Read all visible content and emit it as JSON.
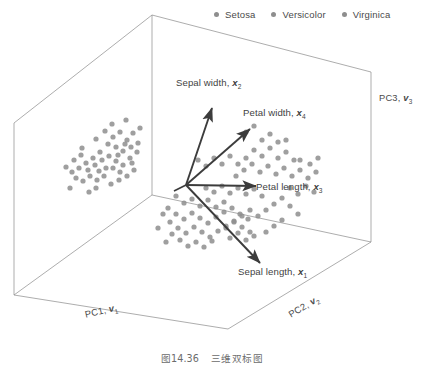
{
  "figure": {
    "caption_number": "图14.36",
    "caption_title": "三维双标图"
  },
  "legend": {
    "position": "top-right",
    "items": [
      {
        "label": "Setosa",
        "color": "#8e8e8e",
        "marker": "legend-dot-setosa"
      },
      {
        "label": "Versicolor",
        "color": "#8e8e8e",
        "marker": "legend-dot-versicolor"
      },
      {
        "label": "Virginica",
        "color": "#8e8e8e",
        "marker": "legend-dot-virginica"
      }
    ]
  },
  "axes": {
    "pc1": {
      "text": "PC1,",
      "vector": "v",
      "sub": "1"
    },
    "pc2": {
      "text": "PC2,",
      "vector": "v",
      "sub": "2"
    },
    "pc3": {
      "text": "PC3,",
      "vector": "v",
      "sub": "3"
    }
  },
  "vectors": [
    {
      "name": "sepal-width",
      "text": "Sepal width,",
      "var": "x",
      "sub": "2"
    },
    {
      "name": "petal-width",
      "text": "Petal width,",
      "var": "x",
      "sub": "4"
    },
    {
      "name": "petal-length",
      "text": "Petal length,",
      "var": "x",
      "sub": "3"
    },
    {
      "name": "sepal-length",
      "text": "Sepal length,",
      "var": "x",
      "sub": "1"
    }
  ],
  "colors": {
    "point": "#8e8e8e",
    "frame": "#8a8a8a",
    "arrow": "#3c3c3c",
    "text": "#3f3f3f"
  },
  "chart_data": {
    "type": "scatter",
    "title": "三维双标图",
    "xlabel": "PC1, v1",
    "ylabel": "PC2, v2",
    "zlabel": "PC3, v3",
    "grid": false,
    "legend_position": "top-right",
    "series": [
      {
        "name": "Setosa",
        "color": "#8e8e8e",
        "points": [
          [
            82,
            148
          ],
          [
            96,
            139
          ],
          [
            105,
            131
          ],
          [
            113,
            137
          ],
          [
            120,
            132
          ],
          [
            127,
            140
          ],
          [
            133,
            133
          ],
          [
            108,
            144
          ],
          [
            116,
            147
          ],
          [
            123,
            151
          ],
          [
            131,
            147
          ],
          [
            138,
            143
          ],
          [
            100,
            152
          ],
          [
            93,
            158
          ],
          [
            86,
            163
          ],
          [
            79,
            168
          ],
          [
            72,
            172
          ],
          [
            66,
            167
          ],
          [
            74,
            160
          ],
          [
            81,
            155
          ],
          [
            88,
            170
          ],
          [
            95,
            165
          ],
          [
            102,
            160
          ],
          [
            109,
            156
          ],
          [
            116,
            161
          ],
          [
            123,
            165
          ],
          [
            130,
            158
          ],
          [
            137,
            152
          ],
          [
            113,
            168
          ],
          [
            120,
            172
          ],
          [
            104,
            176
          ],
          [
            97,
            180
          ],
          [
            90,
            176
          ],
          [
            83,
            181
          ],
          [
            76,
            178
          ],
          [
            112,
            124
          ],
          [
            126,
            120
          ],
          [
            140,
            128
          ],
          [
            134,
            170
          ],
          [
            127,
            176
          ],
          [
            119,
            180
          ],
          [
            111,
            184
          ],
          [
            70,
            188
          ],
          [
            96,
            188
          ],
          [
            89,
            192
          ],
          [
            106,
            168
          ],
          [
            99,
            171
          ],
          [
            118,
            155
          ],
          [
            125,
            144
          ],
          [
            132,
            163
          ]
        ]
      },
      {
        "name": "Versicolor",
        "color": "#8e8e8e",
        "points": [
          [
            176,
            196
          ],
          [
            184,
            203
          ],
          [
            192,
            199
          ],
          [
            200,
            206
          ],
          [
            208,
            200
          ],
          [
            216,
            207
          ],
          [
            224,
            202
          ],
          [
            168,
            208
          ],
          [
            176,
            214
          ],
          [
            184,
            219
          ],
          [
            192,
            213
          ],
          [
            200,
            218
          ],
          [
            208,
            223
          ],
          [
            216,
            217
          ],
          [
            224,
            212
          ],
          [
            232,
            208
          ],
          [
            240,
            214
          ],
          [
            248,
            219
          ],
          [
            170,
            222
          ],
          [
            178,
            228
          ],
          [
            186,
            233
          ],
          [
            194,
            227
          ],
          [
            202,
            232
          ],
          [
            210,
            237
          ],
          [
            218,
            231
          ],
          [
            226,
            226
          ],
          [
            234,
            221
          ],
          [
            242,
            227
          ],
          [
            250,
            232
          ],
          [
            163,
            214
          ],
          [
            196,
            242
          ],
          [
            204,
            247
          ],
          [
            212,
            241
          ],
          [
            188,
            246
          ],
          [
            180,
            240
          ],
          [
            230,
            238
          ],
          [
            238,
            233
          ],
          [
            246,
            240
          ],
          [
            254,
            236
          ],
          [
            172,
            234
          ],
          [
            158,
            228
          ],
          [
            166,
            242
          ],
          [
            206,
            188
          ],
          [
            214,
            192
          ],
          [
            222,
            186
          ],
          [
            230,
            193
          ],
          [
            238,
            188
          ],
          [
            246,
            194
          ],
          [
            254,
            189
          ],
          [
            262,
            196
          ]
        ]
      },
      {
        "name": "Virginica",
        "color": "#8e8e8e",
        "points": [
          [
            236,
            176
          ],
          [
            244,
            170
          ],
          [
            252,
            164
          ],
          [
            260,
            172
          ],
          [
            268,
            166
          ],
          [
            276,
            174
          ],
          [
            284,
            168
          ],
          [
            292,
            176
          ],
          [
            300,
            170
          ],
          [
            308,
            178
          ],
          [
            316,
            172
          ],
          [
            254,
            150
          ],
          [
            262,
            156
          ],
          [
            270,
            148
          ],
          [
            278,
            158
          ],
          [
            286,
            152
          ],
          [
            294,
            160
          ],
          [
            262,
            140
          ],
          [
            270,
            134
          ],
          [
            278,
            142
          ],
          [
            246,
            158
          ],
          [
            238,
            164
          ],
          [
            230,
            156
          ],
          [
            222,
            164
          ],
          [
            214,
            158
          ],
          [
            206,
            166
          ],
          [
            198,
            160
          ],
          [
            290,
            188
          ],
          [
            298,
            194
          ],
          [
            306,
            186
          ],
          [
            314,
            192
          ],
          [
            282,
            198
          ],
          [
            274,
            204
          ],
          [
            266,
            210
          ],
          [
            258,
            216
          ],
          [
            250,
            210
          ],
          [
            242,
            216
          ],
          [
            234,
            222
          ],
          [
            226,
            228
          ],
          [
            290,
            206
          ],
          [
            298,
            214
          ],
          [
            282,
            220
          ],
          [
            274,
            226
          ],
          [
            266,
            232
          ],
          [
            300,
            160
          ],
          [
            310,
            164
          ],
          [
            318,
            158
          ],
          [
            246,
            132
          ],
          [
            254,
            126
          ],
          [
            286,
            140
          ]
        ]
      }
    ]
  }
}
